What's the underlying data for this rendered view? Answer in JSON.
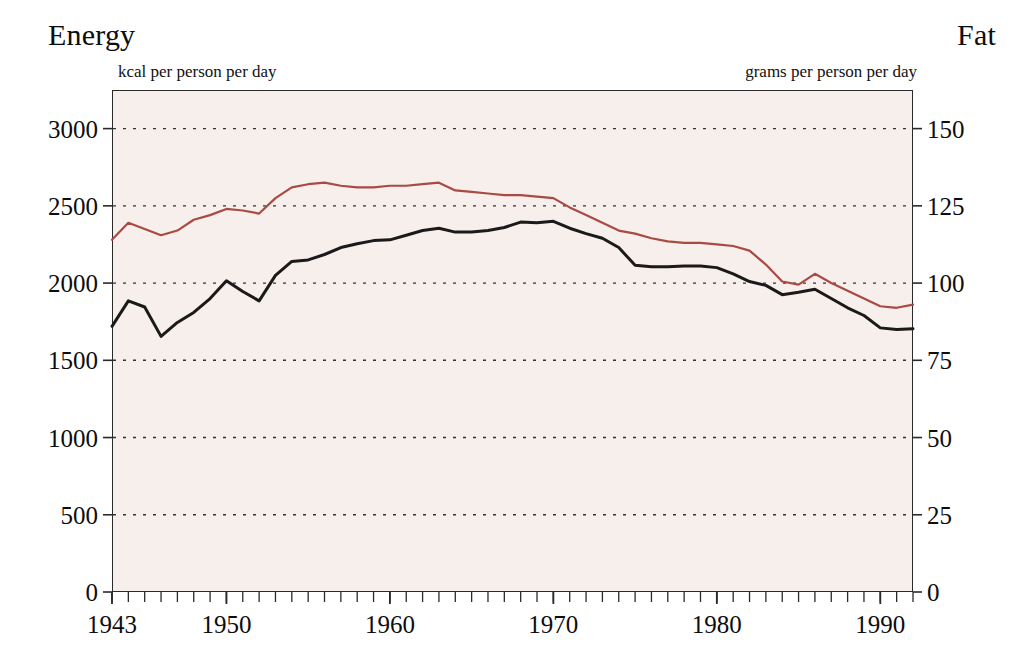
{
  "titles": {
    "left": "Energy",
    "right": "Fat"
  },
  "units": {
    "left": "kcal per person per day",
    "right": "grams per person per day"
  },
  "chart_data": {
    "type": "line",
    "title": "",
    "xlabel": "",
    "ylabel": "Energy",
    "y2label": "Fat",
    "xlim": [
      1943,
      1992
    ],
    "ylim": [
      0,
      3250
    ],
    "y2lim": [
      0,
      162.5
    ],
    "grid": true,
    "grid_style": "dotted horizontal",
    "legend": "none",
    "background": "#f7efeb",
    "xticks": [
      1943,
      1950,
      1960,
      1970,
      1980,
      1990
    ],
    "xtick_labels": [
      "1943",
      "1950",
      "1960",
      "1970",
      "1980",
      "1990"
    ],
    "xminor_tick_interval": 1,
    "yticks": [
      0,
      500,
      1000,
      1500,
      2000,
      2500,
      3000
    ],
    "ytick_labels": [
      "0",
      "500",
      "1000",
      "1500",
      "2000",
      "2500",
      "3000"
    ],
    "y2ticks": [
      0,
      25,
      50,
      75,
      100,
      125,
      150
    ],
    "y2tick_labels": [
      "0",
      "25",
      "50",
      "75",
      "100",
      "125",
      "150"
    ],
    "x": [
      1943,
      1944,
      1945,
      1946,
      1947,
      1948,
      1949,
      1950,
      1951,
      1952,
      1953,
      1954,
      1955,
      1956,
      1957,
      1958,
      1959,
      1960,
      1961,
      1962,
      1963,
      1964,
      1965,
      1966,
      1967,
      1968,
      1969,
      1970,
      1971,
      1972,
      1973,
      1974,
      1975,
      1976,
      1977,
      1978,
      1979,
      1980,
      1981,
      1982,
      1983,
      1984,
      1985,
      1986,
      1987,
      1988,
      1989,
      1990,
      1991,
      1992
    ],
    "series": [
      {
        "name": "Energy",
        "axis": "left",
        "color": "#1a1a1a",
        "linewidth": 3,
        "unit": "kcal per person per day",
        "values": [
          1720,
          1885,
          1845,
          1655,
          1745,
          1810,
          1900,
          2015,
          1945,
          1885,
          2050,
          2140,
          2150,
          2185,
          2230,
          2255,
          2275,
          2280,
          2310,
          2340,
          2355,
          2330,
          2330,
          2340,
          2360,
          2395,
          2390,
          2400,
          2355,
          2320,
          2290,
          2230,
          2115,
          2105,
          2105,
          2110,
          2110,
          2100,
          2060,
          2010,
          1985,
          1925,
          1940,
          1960,
          1900,
          1840,
          1790,
          1710,
          1700,
          1705
        ]
      },
      {
        "name": "Fat",
        "axis": "right",
        "color": "#a94a45",
        "linewidth": 2.2,
        "unit": "grams per person per day",
        "values": [
          114.0,
          119.5,
          117.5,
          115.5,
          117.0,
          120.5,
          122.0,
          124.0,
          123.5,
          122.5,
          127.5,
          131.0,
          132.0,
          132.5,
          131.5,
          131.0,
          131.0,
          131.5,
          131.5,
          132.0,
          132.5,
          130.0,
          129.5,
          129.0,
          128.5,
          128.5,
          128.0,
          127.5,
          124.5,
          122.0,
          119.5,
          117.0,
          116.0,
          114.5,
          113.5,
          113.0,
          113.0,
          112.5,
          112.0,
          110.5,
          106.0,
          100.5,
          99.5,
          103.0,
          100.0,
          97.5,
          95.0,
          92.5,
          92.0,
          93.0
        ]
      }
    ]
  }
}
